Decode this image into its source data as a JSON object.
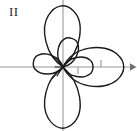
{
  "figure": {
    "label": "II",
    "caption_label": "II",
    "background_color": "#ffffff",
    "curve_color": "#1a1a1a",
    "axis_color": "#9a9a9a",
    "label_color": "#2b2b2b",
    "width": 137,
    "height": 131
  },
  "axes": {
    "origin": {
      "x": 63,
      "y": 67
    },
    "x_axis": {
      "x1": 0,
      "y1": 67,
      "x2": 133,
      "y2": 67,
      "arrow": "right",
      "arrow_label": "x-axis-arrow"
    },
    "y_axis": {
      "x1": 63,
      "y1": 0,
      "x2": 63,
      "y2": 131,
      "arrow": "none"
    },
    "ticks": [
      {
        "name": "x-tick-above",
        "x": 101,
        "y": 67,
        "side": "above",
        "length": 7
      },
      {
        "name": "x-tick-below",
        "x": 78,
        "y": 67,
        "side": "below",
        "length": 7
      }
    ]
  },
  "chart_data": {
    "type": "line",
    "subtype": "polar-rose",
    "title": "II",
    "xlabel": "",
    "ylabel": "",
    "grid": false,
    "legend": null,
    "equation": "r = a·cos(3θ) with inner loops (three-petal rose)",
    "petal_count": 3,
    "petals": [
      {
        "name": "right-petal",
        "angle_deg": 0,
        "outer_tip": {
          "x": 123,
          "y": 67
        },
        "inner_tip": {
          "x": 92,
          "y": 67
        },
        "outer_radius": 60,
        "inner_radius": 29
      },
      {
        "name": "upper-left-petal",
        "angle_deg": 120,
        "outer_tip": {
          "x": 33,
          "y": 20
        },
        "inner_tip": {
          "x": 48,
          "y": 43
        },
        "outer_radius": 60,
        "inner_radius": 29
      },
      {
        "name": "lower-left-petal",
        "angle_deg": 240,
        "outer_tip": {
          "x": 33,
          "y": 114
        },
        "inner_tip": {
          "x": 48,
          "y": 91
        },
        "outer_radius": 60,
        "inner_radius": 29
      }
    ],
    "theta_range_deg": [
      0,
      360
    ],
    "r_max": 60,
    "r_inner": 29,
    "stroke_width": 1.4
  }
}
